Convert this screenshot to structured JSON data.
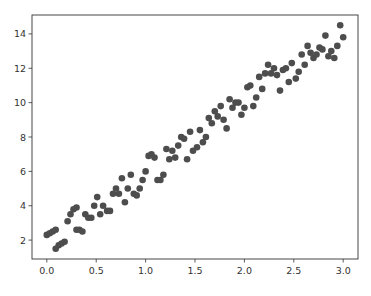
{
  "chart_data": {
    "type": "scatter",
    "title": "",
    "xlabel": "",
    "ylabel": "",
    "xlim": [
      -0.15,
      3.15
    ],
    "ylim": [
      0.9,
      15.1
    ],
    "xticks": [
      0.0,
      0.5,
      1.0,
      1.5,
      2.0,
      2.5,
      3.0
    ],
    "xtick_labels": [
      "0.0",
      "0.5",
      "1.0",
      "1.5",
      "2.0",
      "2.5",
      "3.0"
    ],
    "yticks": [
      2,
      4,
      6,
      8,
      10,
      12,
      14
    ],
    "ytick_labels": [
      "2",
      "4",
      "6",
      "8",
      "10",
      "12",
      "14"
    ],
    "grid": false,
    "legend": null,
    "marker_color": "#4d4d4d",
    "series": [
      {
        "name": "data",
        "x": [
          0.0,
          0.03,
          0.06,
          0.09,
          0.09,
          0.12,
          0.15,
          0.18,
          0.21,
          0.24,
          0.27,
          0.3,
          0.3,
          0.33,
          0.36,
          0.39,
          0.42,
          0.45,
          0.48,
          0.51,
          0.54,
          0.57,
          0.61,
          0.64,
          0.67,
          0.7,
          0.73,
          0.76,
          0.79,
          0.82,
          0.85,
          0.88,
          0.91,
          0.94,
          0.97,
          1.0,
          1.03,
          1.06,
          1.09,
          1.12,
          1.15,
          1.18,
          1.21,
          1.24,
          1.27,
          1.3,
          1.33,
          1.36,
          1.39,
          1.42,
          1.45,
          1.48,
          1.52,
          1.55,
          1.58,
          1.61,
          1.64,
          1.67,
          1.7,
          1.73,
          1.76,
          1.79,
          1.82,
          1.85,
          1.88,
          1.91,
          1.94,
          1.97,
          2.0,
          2.03,
          2.06,
          2.09,
          2.12,
          2.15,
          2.18,
          2.21,
          2.24,
          2.27,
          2.3,
          2.33,
          2.36,
          2.39,
          2.42,
          2.45,
          2.48,
          2.52,
          2.55,
          2.58,
          2.61,
          2.64,
          2.67,
          2.7,
          2.73,
          2.76,
          2.79,
          2.82,
          2.85,
          2.88,
          2.91,
          2.94,
          2.97,
          3.0
        ],
        "y": [
          2.3,
          2.4,
          2.5,
          2.6,
          1.5,
          1.7,
          1.8,
          1.9,
          3.1,
          3.5,
          3.8,
          3.9,
          2.6,
          2.6,
          2.5,
          3.5,
          3.3,
          3.3,
          4.0,
          4.5,
          3.5,
          4.0,
          3.7,
          3.7,
          4.7,
          5.0,
          4.7,
          5.6,
          4.2,
          5.0,
          5.8,
          4.7,
          4.6,
          5.0,
          5.5,
          6.0,
          6.9,
          7.0,
          6.8,
          5.5,
          5.5,
          5.8,
          7.3,
          6.7,
          7.2,
          6.8,
          7.5,
          8.0,
          7.9,
          6.7,
          8.3,
          7.2,
          7.4,
          8.4,
          7.7,
          8.0,
          9.1,
          8.8,
          9.5,
          9.2,
          9.8,
          9.0,
          8.5,
          10.2,
          9.7,
          10.0,
          10.0,
          9.3,
          9.7,
          10.9,
          11.0,
          9.8,
          10.3,
          11.5,
          10.8,
          11.7,
          12.2,
          11.7,
          12.0,
          11.6,
          10.7,
          11.9,
          12.0,
          11.2,
          12.3,
          11.4,
          11.8,
          12.8,
          12.2,
          13.3,
          12.9,
          12.6,
          12.8,
          13.2,
          13.1,
          13.9,
          12.7,
          13.0,
          12.6,
          13.3,
          14.5,
          13.8
        ]
      }
    ]
  },
  "figure": {
    "width": 371,
    "height": 296,
    "plot_area": {
      "left": 32,
      "top": 15,
      "right": 358,
      "bottom": 259
    }
  }
}
